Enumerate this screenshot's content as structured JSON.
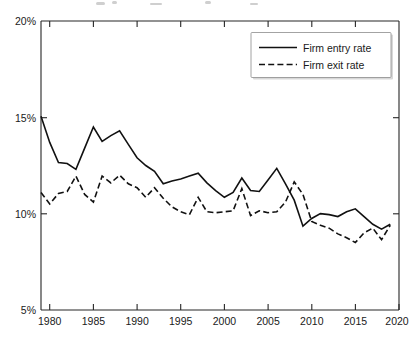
{
  "chart_data": {
    "type": "line",
    "title": "",
    "subtitle": "",
    "xlabel": "",
    "ylabel": "",
    "xlim": [
      1979,
      2020
    ],
    "ylim": [
      5,
      20
    ],
    "grid": false,
    "legend_position": "top-right",
    "x_tick_labels": [
      "1980",
      "1985",
      "1990",
      "1995",
      "2000",
      "2005",
      "2010",
      "2015",
      "2020"
    ],
    "x_ticks": [
      1980,
      1985,
      1990,
      1995,
      2000,
      2005,
      2010,
      2015,
      2020
    ],
    "y_tick_labels": [
      "5%",
      "10%",
      "15%",
      "20%"
    ],
    "y_ticks": [
      5,
      10,
      15,
      20
    ],
    "x": [
      1979,
      1980,
      1981,
      1982,
      1983,
      1984,
      1985,
      1986,
      1987,
      1988,
      1989,
      1990,
      1991,
      1992,
      1993,
      1994,
      1995,
      1996,
      1997,
      1998,
      1999,
      2000,
      2001,
      2002,
      2003,
      2004,
      2005,
      2006,
      2007,
      2008,
      2009,
      2010,
      2011,
      2012,
      2013,
      2014,
      2015,
      2016,
      2017,
      2018,
      2019
    ],
    "series": [
      {
        "name": "Firm entry rate",
        "style": "solid",
        "color": "#111111",
        "values": [
          15.05,
          13.7,
          12.65,
          12.6,
          12.3,
          13.4,
          14.5,
          13.75,
          14.05,
          14.3,
          13.6,
          12.9,
          12.5,
          12.2,
          11.55,
          11.7,
          11.8,
          11.95,
          12.1,
          11.6,
          11.2,
          10.85,
          11.1,
          11.85,
          11.2,
          11.15,
          11.75,
          12.35,
          11.55,
          10.7,
          9.35,
          9.75,
          10.0,
          9.95,
          9.85,
          10.1,
          10.25,
          9.85,
          9.45,
          9.2,
          9.45
        ]
      },
      {
        "name": "Firm exit rate",
        "style": "dashed",
        "color": "#111111",
        "values": [
          11.1,
          10.5,
          11.05,
          11.15,
          11.95,
          11.0,
          10.6,
          11.95,
          11.6,
          12.0,
          11.55,
          11.35,
          10.85,
          11.35,
          10.8,
          10.35,
          10.1,
          9.95,
          10.85,
          10.1,
          10.05,
          10.1,
          10.15,
          11.3,
          9.9,
          10.15,
          10.05,
          10.1,
          10.6,
          11.65,
          11.0,
          9.6,
          9.4,
          9.25,
          8.95,
          8.75,
          8.5,
          9.0,
          9.25,
          8.65,
          9.4
        ]
      }
    ]
  },
  "legend": {
    "entries": [
      {
        "label": "Firm entry rate",
        "style": "solid"
      },
      {
        "label": "Firm exit rate",
        "style": "dashed"
      }
    ]
  },
  "axes": {
    "y_top_label": "20%",
    "y_mid_upper_label": "15%",
    "y_mid_lower_label": "10%",
    "y_bottom_label": "5%"
  }
}
